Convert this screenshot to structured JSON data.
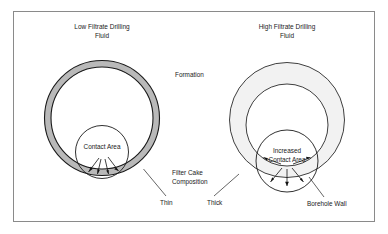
{
  "figure": {
    "width": 388,
    "height": 234,
    "background_color": "#ffffff",
    "frame_color": "#8a8a8a",
    "text_color": "#1a1a1a"
  },
  "panels": {
    "left": {
      "title_line1": "Low Filtrate Drilling",
      "title_line2": "Fluid",
      "contact_label": "Contact Area",
      "cake_thickness_label": "Thin",
      "cake_fill_color": "#b9b9b9",
      "arrow_count": 4
    },
    "right": {
      "title_line1": "High Filtrate Drilling",
      "title_line2": "Fluid",
      "contact_label_line1": "Increased",
      "contact_label_line2": "Contact Area",
      "cake_thickness_label": "Thick",
      "cake_fill_color": "#f2f2f2",
      "arrow_count": 5
    }
  },
  "annotations": {
    "formation": "Formation",
    "filter_cake_line1": "Filter Cake",
    "filter_cake_line2": "Composition",
    "borehole_wall": "Borehole Wall"
  }
}
